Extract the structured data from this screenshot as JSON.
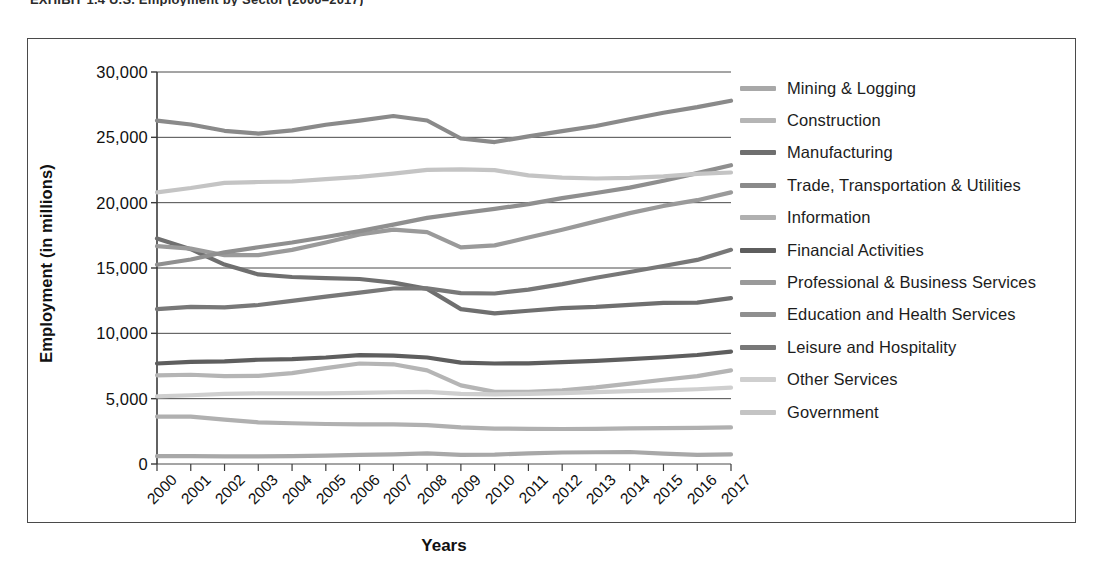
{
  "figure": {
    "title": "EXHIBIT 1.4  U.S. Employment by Sector (2000–2017)"
  },
  "axes": {
    "y_title": "Employment (in millions)",
    "x_title": "Years",
    "y_ticks": [
      "0",
      "5,000",
      "10,000",
      "15,000",
      "20,000",
      "25,000",
      "30,000"
    ]
  },
  "legend": {
    "position": "right",
    "items": [
      {
        "label": "Mining & Logging",
        "color": "#a8a8a8"
      },
      {
        "label": "Construction",
        "color": "#b5b5b5"
      },
      {
        "label": "Manufacturing",
        "color": "#6f6f6f"
      },
      {
        "label": "Trade, Transportation & Utilities",
        "color": "#8a8a8a"
      },
      {
        "label": "Information",
        "color": "#b0b0b0"
      },
      {
        "label": "Financial Activities",
        "color": "#5e5e5e"
      },
      {
        "label": "Professional & Business Services",
        "color": "#9a9a9a"
      },
      {
        "label": "Education and Health Services",
        "color": "#8f8f8f"
      },
      {
        "label": "Leisure and Hospitality",
        "color": "#787878"
      },
      {
        "label": "Other Services",
        "color": "#cfcfcf"
      },
      {
        "label": "Government",
        "color": "#c4c4c4"
      }
    ]
  },
  "chart_data": {
    "type": "line",
    "title": "U.S. Employment by Sector (2000–2017)",
    "xlabel": "Years",
    "ylabel": "Employment (in millions)",
    "ylim": [
      0,
      30000
    ],
    "ytick_step": 5000,
    "grid": "horizontal",
    "legend_position": "right",
    "categories": [
      "2000",
      "2001",
      "2002",
      "2003",
      "2004",
      "2005",
      "2006",
      "2007",
      "2008",
      "2009",
      "2010",
      "2011",
      "2012",
      "2013",
      "2014",
      "2015",
      "2016",
      "2017"
    ],
    "series": [
      {
        "name": "Mining & Logging",
        "color": "#a8a8a8",
        "values": [
          600,
          610,
          590,
          580,
          600,
          640,
          700,
          740,
          820,
          700,
          720,
          820,
          880,
          900,
          920,
          800,
          700,
          730
        ]
      },
      {
        "name": "Construction",
        "color": "#b5b5b5",
        "values": [
          6790,
          6830,
          6720,
          6740,
          6960,
          7340,
          7690,
          7630,
          7160,
          6020,
          5520,
          5530,
          5640,
          5860,
          6150,
          6450,
          6720,
          7170
        ]
      },
      {
        "name": "Manufacturing",
        "color": "#6f6f6f",
        "values": [
          17260,
          16440,
          15260,
          14510,
          14310,
          14230,
          14160,
          13880,
          13400,
          11850,
          11530,
          11730,
          11930,
          12020,
          12180,
          12330,
          12350,
          12690
        ]
      },
      {
        "name": "Trade, Transportation & Utilities",
        "color": "#8a8a8a",
        "values": [
          26280,
          25980,
          25500,
          25290,
          25530,
          25960,
          26280,
          26630,
          26290,
          24910,
          24640,
          25070,
          25480,
          25870,
          26380,
          26880,
          27310,
          27800
        ]
      },
      {
        "name": "Information",
        "color": "#b0b0b0",
        "values": [
          3630,
          3630,
          3400,
          3190,
          3120,
          3060,
          3040,
          3030,
          2980,
          2800,
          2710,
          2690,
          2680,
          2690,
          2730,
          2750,
          2770,
          2800
        ]
      },
      {
        "name": "Financial Activities",
        "color": "#5e5e5e",
        "values": [
          7690,
          7810,
          7850,
          7980,
          8030,
          8150,
          8330,
          8300,
          8150,
          7760,
          7690,
          7700,
          7790,
          7890,
          8020,
          8170,
          8340,
          8600
        ]
      },
      {
        "name": "Professional & Business Services",
        "color": "#9a9a9a",
        "values": [
          16670,
          16480,
          15980,
          15990,
          16390,
          16950,
          17570,
          17940,
          17740,
          16580,
          16730,
          17330,
          17930,
          18570,
          19200,
          19750,
          20190,
          20790
        ]
      },
      {
        "name": "Education and Health Services",
        "color": "#8f8f8f",
        "values": [
          15250,
          15650,
          16200,
          16590,
          16950,
          17370,
          17820,
          18320,
          18840,
          19190,
          19520,
          19890,
          20350,
          20740,
          21150,
          21680,
          22260,
          22870
        ]
      },
      {
        "name": "Leisure and Hospitality",
        "color": "#787878",
        "values": [
          11860,
          12030,
          11990,
          12170,
          12490,
          12810,
          13110,
          13430,
          13440,
          13080,
          13050,
          13350,
          13770,
          14250,
          14690,
          15150,
          15620,
          16390
        ]
      },
      {
        "name": "Other Services",
        "color": "#cfcfcf",
        "values": [
          5170,
          5260,
          5370,
          5400,
          5410,
          5400,
          5440,
          5490,
          5520,
          5370,
          5330,
          5360,
          5430,
          5500,
          5570,
          5630,
          5720,
          5840
        ]
      },
      {
        "name": "Government",
        "color": "#c4c4c4",
        "values": [
          20790,
          21120,
          21510,
          21580,
          21620,
          21800,
          21970,
          22220,
          22510,
          22550,
          22490,
          22090,
          21920,
          21850,
          21890,
          22010,
          22200,
          22310
        ]
      }
    ]
  }
}
